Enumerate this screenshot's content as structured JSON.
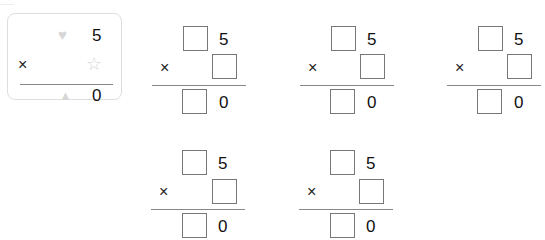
{
  "example": {
    "top_symbol": "heart",
    "top_digit": "5",
    "operator": "×",
    "multiplier_symbol": "star",
    "result_symbol": "triangle",
    "result_digit": "0",
    "symbol_color": "#d6d6d6"
  },
  "problems": [
    {
      "top_digit": "5",
      "operator": "×",
      "result_digit": "0",
      "top_box": "",
      "multiplier_box": "",
      "result_box": ""
    },
    {
      "top_digit": "5",
      "operator": "×",
      "result_digit": "0",
      "top_box": "",
      "multiplier_box": "",
      "result_box": ""
    },
    {
      "top_digit": "5",
      "operator": "×",
      "result_digit": "0",
      "top_box": "",
      "multiplier_box": "",
      "result_box": ""
    },
    {
      "top_digit": "5",
      "operator": "×",
      "result_digit": "0",
      "top_box": "",
      "multiplier_box": "",
      "result_box": ""
    },
    {
      "top_digit": "5",
      "operator": "×",
      "result_digit": "0",
      "top_box": "",
      "multiplier_box": "",
      "result_box": ""
    }
  ]
}
